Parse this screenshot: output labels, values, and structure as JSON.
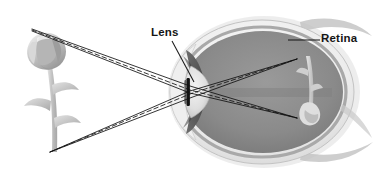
{
  "diagram": {
    "background_color": "#ffffff",
    "width": 377,
    "height": 176,
    "style": "grayscale anatomical illustration"
  },
  "labels": {
    "lens": "Lens",
    "retina": "Retina"
  },
  "colors": {
    "label_text": "#151515",
    "leader_line": "#1a1a1a",
    "ray_line": "#111111",
    "eye_outer": "#d9d9d9",
    "eye_sclera": "#eeeeee",
    "vitreous": "#8a8a8a",
    "lens_body": "#e2e2e2",
    "iris": "#5a5a5a",
    "pupil_bar": "#151515",
    "flower_petal": "#b3b3b3",
    "flower_stem": "#c9c9c9",
    "retina_image": "#cfcfcf"
  },
  "objects": {
    "flower": {
      "name": "flower",
      "description": "Grayscale rose-like flower with stem and three leaves, viewed object",
      "top_point": {
        "x": 32,
        "y": 29
      },
      "bottom_point": {
        "x": 50,
        "y": 152
      }
    },
    "eye": {
      "name": "eye",
      "description": "Cross-section of a human eyeball facing left",
      "center": {
        "x": 262,
        "y": 92
      },
      "radius_x": 92,
      "radius_y": 72
    },
    "lens": {
      "name": "lens",
      "description": "Biconvex crystalline lens behind the pupil",
      "center": {
        "x": 196,
        "y": 92
      }
    },
    "retina_image": {
      "name": "inverted-retinal-image",
      "description": "Small inverted image of the flower projected on the retina",
      "center": {
        "x": 308,
        "y": 90
      }
    }
  },
  "rays": {
    "description": "Light rays from the top and bottom of the flower refract through the lens and converge inverted on the retina",
    "solid": [
      {
        "name": "ray-top-solid-1",
        "points": [
          [
            32,
            29
          ],
          [
            190,
            86
          ],
          [
            297,
            118
          ]
        ]
      },
      {
        "name": "ray-top-solid-2",
        "points": [
          [
            32,
            31
          ],
          [
            190,
            93
          ],
          [
            297,
            118
          ]
        ]
      },
      {
        "name": "ray-bottom-solid-1",
        "points": [
          [
            50,
            152
          ],
          [
            190,
            98
          ],
          [
            297,
            59
          ]
        ]
      },
      {
        "name": "ray-bottom-solid-2",
        "points": [
          [
            50,
            152
          ],
          [
            190,
            91
          ],
          [
            297,
            59
          ]
        ]
      }
    ],
    "dashed": [
      {
        "name": "ray-top-dashed",
        "points": [
          [
            32,
            30
          ],
          [
            190,
            90
          ],
          [
            297,
            118
          ]
        ]
      },
      {
        "name": "ray-bottom-dashed",
        "points": [
          [
            50,
            152
          ],
          [
            190,
            94
          ],
          [
            297,
            59
          ]
        ]
      }
    ],
    "convergence_points": [
      {
        "name": "upper-focus",
        "x": 297,
        "y": 59
      },
      {
        "name": "lower-focus",
        "x": 297,
        "y": 118
      }
    ]
  },
  "leaders": {
    "lens": {
      "from": {
        "x": 172,
        "y": 41
      },
      "to": {
        "x": 194,
        "y": 82
      }
    },
    "retina": {
      "from": {
        "x": 320,
        "y": 40
      },
      "to": {
        "x": 288,
        "y": 40
      }
    }
  }
}
